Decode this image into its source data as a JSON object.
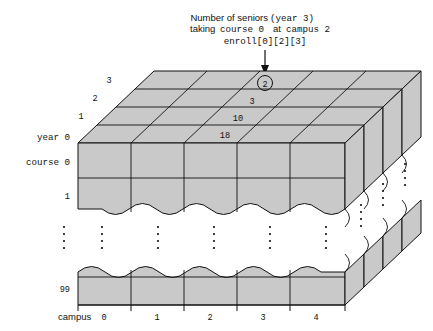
{
  "figure": {
    "title_missing": "",
    "callout": {
      "line1_a": "Number of seniors",
      "line1_b": "(year 3)",
      "line2_a": "taking",
      "line2_b": "course 0",
      "line2_c": "at",
      "line2_d": "campus 2",
      "line3": "enroll[0][2][3]",
      "marker_value": "2",
      "arrow_icon": "down-arrow-icon"
    },
    "depth_axis": {
      "label": "year 0",
      "ticks": [
        "3",
        "2",
        "1"
      ],
      "origin_tick": "0"
    },
    "row_axis": {
      "label": "course 0",
      "ticks": [
        "1",
        "99"
      ]
    },
    "column_axis": {
      "label": "campus",
      "ticks": [
        "0",
        "1",
        "2",
        "3",
        "4"
      ]
    },
    "cell_values": [
      {
        "value": "3"
      },
      {
        "value": "10"
      },
      {
        "value": "18"
      }
    ],
    "ellipsis_glyph": "⋮",
    "colors": {
      "face_fill": "#c9c9c9",
      "stroke": "#111111",
      "background": "#ffffff"
    }
  }
}
